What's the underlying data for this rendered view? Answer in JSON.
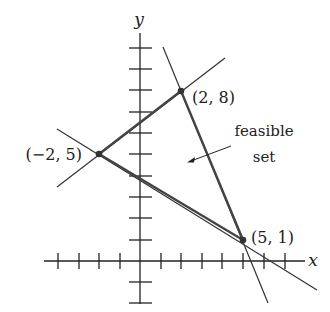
{
  "diagram": {
    "title": "",
    "axes": {
      "x_label": "x",
      "y_label": "y",
      "x_ticks": [
        -4,
        -3,
        -2,
        -1,
        1,
        2,
        3,
        4,
        5,
        6,
        7
      ],
      "y_ticks": [
        -2,
        -1,
        1,
        2,
        3,
        4,
        5,
        6,
        7,
        8,
        9,
        10
      ]
    },
    "vertices": [
      {
        "label": "(2, 8)",
        "x": 2,
        "y": 8
      },
      {
        "label": "(−2, 5)",
        "x": -2,
        "y": 5
      },
      {
        "label": "(5, 1)",
        "x": 5,
        "y": 1
      }
    ],
    "region_label_line1": "feasible",
    "region_label_line2": "set",
    "colors": {
      "edge": "#444444",
      "axis": "#222222",
      "background": "#ffffff"
    }
  }
}
